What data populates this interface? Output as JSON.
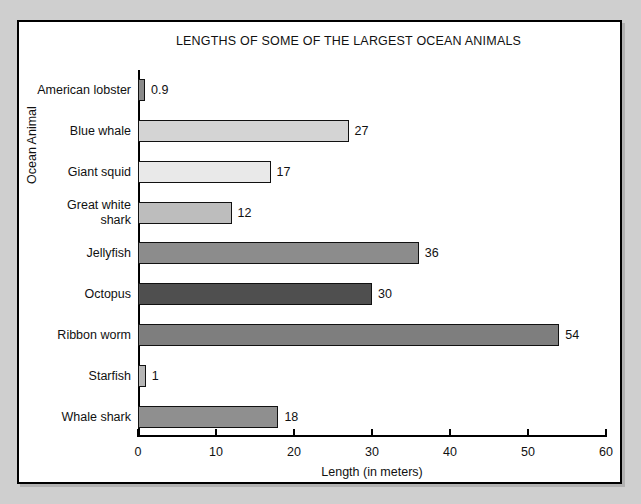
{
  "chart_data": {
    "type": "bar",
    "orientation": "horizontal",
    "title": "LENGTHS OF SOME OF THE LARGEST OCEAN ANIMALS",
    "xlabel": "Length (in meters)",
    "ylabel": "Ocean Animal",
    "xlim": [
      0,
      60
    ],
    "xticks": [
      "0",
      "10",
      "20",
      "30",
      "40",
      "50",
      "60"
    ],
    "grid": false,
    "legend": null,
    "categories": [
      "American lobster",
      "Blue whale",
      "Giant squid",
      "Great white\nshark",
      "Jellyfish",
      "Octopus",
      "Ribbon worm",
      "Starfish",
      "Whale shark"
    ],
    "values": [
      0.9,
      27,
      17,
      12,
      36,
      30,
      54,
      1,
      18
    ],
    "value_labels": [
      "0.9",
      "27",
      "17",
      "12",
      "36",
      "30",
      "54",
      "1",
      "18"
    ],
    "bar_colors": [
      "#8a8a8a",
      "#d4d4d4",
      "#e9e9e9",
      "#bdbdbd",
      "#8c8c8c",
      "#4f4f4f",
      "#7e7e7e",
      "#b5b5b5",
      "#8f8f8f"
    ],
    "bar_edge_color": "#111111",
    "background_color": "#ffffff",
    "page_background_color": "#cfcfcf"
  }
}
